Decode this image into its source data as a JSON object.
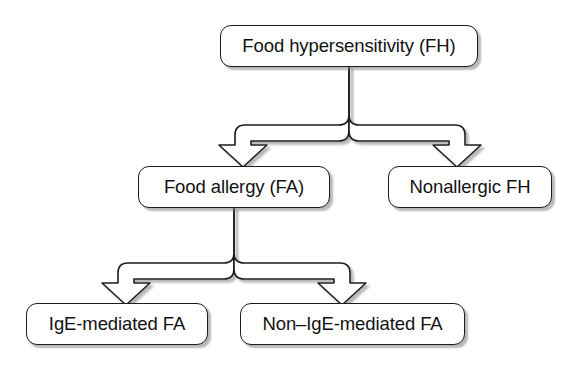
{
  "diagram": {
    "type": "hierarchy-flowchart",
    "style": {
      "box_fill": "#ffffff",
      "box_border": "#1d1d1d",
      "text_color": "#121212",
      "shadow_color": "#7d7d7d",
      "connector_stroke": "#1d1d1d",
      "connector_fill": "#ffffff",
      "background": "#ffffff"
    },
    "nodes": [
      {
        "id": "root",
        "label": "Food hypersensitivity (FH)",
        "level": 0
      },
      {
        "id": "fa",
        "label": "Food allergy (FA)",
        "level": 1
      },
      {
        "id": "nonallergic",
        "label": "Nonallergic FH",
        "level": 1
      },
      {
        "id": "ige",
        "label": "IgE-mediated FA",
        "level": 2
      },
      {
        "id": "nonige",
        "label": "Non–IgE-mediated FA",
        "level": 2
      }
    ],
    "edges": [
      {
        "from": "root",
        "to": "fa",
        "arrow": "block-arrow-down"
      },
      {
        "from": "root",
        "to": "nonallergic",
        "arrow": "block-arrow-down"
      },
      {
        "from": "fa",
        "to": "ige",
        "arrow": "block-arrow-down"
      },
      {
        "from": "fa",
        "to": "nonige",
        "arrow": "block-arrow-down"
      }
    ]
  }
}
